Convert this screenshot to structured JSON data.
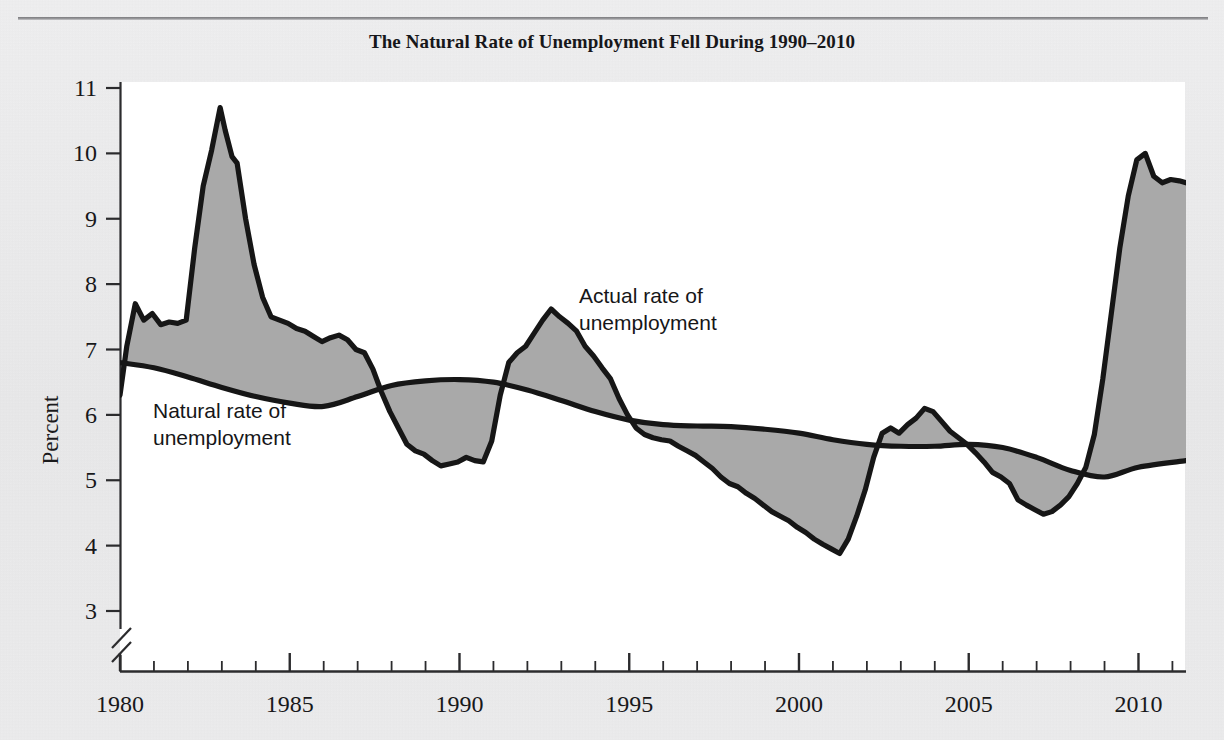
{
  "figure": {
    "title": "The Natural Rate of Unemployment Fell During 1990–2010",
    "background_color": "#ececed",
    "plot_background_color": "#ffffff",
    "fill_color": "#a9a9a9",
    "line_color": "#161616"
  },
  "annotations": [
    {
      "name": "actual-rate-label",
      "line1": "Actual rate of",
      "line2": "unemployment",
      "x": 579,
      "y": 303
    },
    {
      "name": "natural-rate-label",
      "line1": "Natural rate of",
      "line2": "unemployment",
      "x": 153,
      "y": 418
    }
  ],
  "axes": {
    "y_title": "Percent",
    "y_ticks": [
      "11",
      "10",
      "9",
      "8",
      "7",
      "6",
      "5",
      "4",
      "3"
    ],
    "y_tick_values": [
      11,
      10,
      9,
      8,
      7,
      6,
      5,
      4,
      3
    ],
    "y_axis_break": true,
    "x_ticks": [
      "1980",
      "1985",
      "1990",
      "1995",
      "2000",
      "2005",
      "2010"
    ],
    "x_tick_values": [
      1980,
      1985,
      1990,
      1995,
      2000,
      2005,
      2010
    ],
    "x_minor_step": 1
  },
  "chart_data": {
    "type": "line",
    "title": "The Natural Rate of Unemployment Fell During 1990–2010",
    "xlabel": "",
    "ylabel": "Percent",
    "xlim": [
      1980,
      2011.4
    ],
    "ylim": [
      3,
      11
    ],
    "grid": false,
    "legend": "inline-annotations",
    "fill_between": {
      "series_a": "Actual rate of unemployment",
      "series_b": "Natural rate of unemployment",
      "color": "#a9a9a9"
    },
    "series": [
      {
        "name": "Actual rate of unemployment",
        "color": "#161616",
        "x": [
          1980.0,
          1980.2,
          1980.45,
          1980.7,
          1980.95,
          1981.2,
          1981.45,
          1981.7,
          1981.95,
          1982.2,
          1982.45,
          1982.7,
          1982.95,
          1983.1,
          1983.3,
          1983.45,
          1983.7,
          1983.95,
          1984.2,
          1984.45,
          1984.7,
          1984.95,
          1985.2,
          1985.45,
          1985.7,
          1985.95,
          1986.2,
          1986.45,
          1986.7,
          1986.95,
          1987.2,
          1987.45,
          1987.7,
          1987.95,
          1988.2,
          1988.45,
          1988.7,
          1988.95,
          1989.2,
          1989.45,
          1989.7,
          1989.95,
          1990.2,
          1990.45,
          1990.7,
          1990.95,
          1991.2,
          1991.45,
          1991.7,
          1991.95,
          1992.2,
          1992.45,
          1992.7,
          1992.95,
          1993.2,
          1993.45,
          1993.7,
          1993.95,
          1994.2,
          1994.45,
          1994.7,
          1994.95,
          1995.2,
          1995.45,
          1995.7,
          1995.95,
          1996.2,
          1996.45,
          1996.7,
          1996.95,
          1997.2,
          1997.45,
          1997.7,
          1997.95,
          1998.2,
          1998.45,
          1998.7,
          1998.95,
          1999.2,
          1999.45,
          1999.7,
          1999.95,
          2000.2,
          2000.45,
          2000.7,
          2000.95,
          2001.2,
          2001.45,
          2001.7,
          2001.95,
          2002.2,
          2002.45,
          2002.7,
          2002.95,
          2003.2,
          2003.45,
          2003.7,
          2003.95,
          2004.2,
          2004.45,
          2004.7,
          2004.95,
          2005.2,
          2005.45,
          2005.7,
          2005.95,
          2006.2,
          2006.45,
          2006.7,
          2006.95,
          2007.2,
          2007.45,
          2007.7,
          2007.95,
          2008.2,
          2008.45,
          2008.7,
          2008.95,
          2009.2,
          2009.45,
          2009.7,
          2009.95,
          2010.2,
          2010.45,
          2010.7,
          2010.95,
          2011.2,
          2011.4
        ],
        "y": [
          6.3,
          7.05,
          7.7,
          7.45,
          7.55,
          7.38,
          7.42,
          7.4,
          7.45,
          8.55,
          9.5,
          10.05,
          10.7,
          10.35,
          9.95,
          9.85,
          9.0,
          8.3,
          7.8,
          7.5,
          7.45,
          7.4,
          7.32,
          7.28,
          7.2,
          7.12,
          7.18,
          7.22,
          7.15,
          7.0,
          6.95,
          6.7,
          6.35,
          6.05,
          5.8,
          5.55,
          5.45,
          5.4,
          5.3,
          5.22,
          5.25,
          5.28,
          5.35,
          5.3,
          5.28,
          5.6,
          6.3,
          6.8,
          6.95,
          7.05,
          7.25,
          7.45,
          7.62,
          7.5,
          7.4,
          7.28,
          7.05,
          6.9,
          6.72,
          6.55,
          6.25,
          6.0,
          5.8,
          5.7,
          5.65,
          5.62,
          5.6,
          5.52,
          5.45,
          5.38,
          5.28,
          5.18,
          5.05,
          4.95,
          4.9,
          4.8,
          4.72,
          4.62,
          4.52,
          4.45,
          4.38,
          4.28,
          4.2,
          4.1,
          4.02,
          3.95,
          3.88,
          4.1,
          4.45,
          4.85,
          5.35,
          5.72,
          5.8,
          5.72,
          5.85,
          5.95,
          6.1,
          6.05,
          5.9,
          5.75,
          5.65,
          5.55,
          5.42,
          5.28,
          5.12,
          5.05,
          4.95,
          4.7,
          4.62,
          4.55,
          4.48,
          4.52,
          4.62,
          4.75,
          4.95,
          5.2,
          5.7,
          6.55,
          7.55,
          8.55,
          9.35,
          9.9,
          10.0,
          9.65,
          9.55,
          9.6,
          9.58,
          9.55
        ]
      },
      {
        "name": "Natural rate of unemployment",
        "color": "#161616",
        "x": [
          1980.0,
          1981.0,
          1982.0,
          1983.0,
          1984.0,
          1985.0,
          1986.0,
          1987.0,
          1988.0,
          1989.0,
          1990.0,
          1991.0,
          1992.0,
          1993.0,
          1994.0,
          1995.0,
          1996.0,
          1997.0,
          1998.0,
          1999.0,
          2000.0,
          2001.0,
          2002.0,
          2003.0,
          2004.0,
          2005.0,
          2006.0,
          2007.0,
          2008.0,
          2009.0,
          2010.0,
          2011.4
        ],
        "y": [
          6.8,
          6.72,
          6.58,
          6.42,
          6.28,
          6.18,
          6.13,
          6.28,
          6.45,
          6.52,
          6.54,
          6.5,
          6.38,
          6.22,
          6.05,
          5.92,
          5.85,
          5.83,
          5.82,
          5.78,
          5.72,
          5.62,
          5.55,
          5.52,
          5.52,
          5.55,
          5.5,
          5.35,
          5.15,
          5.05,
          5.2,
          5.3
        ]
      }
    ]
  }
}
